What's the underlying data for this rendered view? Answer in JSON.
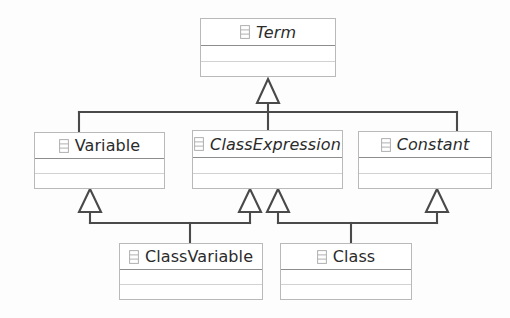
{
  "diagram": {
    "kind": "uml-class-diagram",
    "icon_name": "uml-class-icon",
    "colors": {
      "background": "#fdfdfd",
      "box_fill": "#ffffff",
      "box_border": "#b9b9b9",
      "header_rule": "#8d8d8d",
      "compartment_rule": "#d2d2d2",
      "connector": "#4a4a4a",
      "text": "#2b2b2b"
    },
    "classes": [
      {
        "id": "term",
        "name": "Term",
        "abstract": true,
        "compartments": 2
      },
      {
        "id": "variable",
        "name": "Variable",
        "abstract": false,
        "compartments": 2
      },
      {
        "id": "classexpression",
        "name": "ClassExpression",
        "abstract": true,
        "compartments": 2
      },
      {
        "id": "constant",
        "name": "Constant",
        "abstract": true,
        "compartments": 2
      },
      {
        "id": "classvariable",
        "name": "ClassVariable",
        "abstract": false,
        "compartments": 2
      },
      {
        "id": "class",
        "name": "Class",
        "abstract": false,
        "compartments": 2
      }
    ],
    "generalizations": [
      {
        "subclass": "Variable",
        "superclass": "Term"
      },
      {
        "subclass": "ClassExpression",
        "superclass": "Term"
      },
      {
        "subclass": "Constant",
        "superclass": "Term"
      },
      {
        "subclass": "ClassVariable",
        "superclass": "Variable"
      },
      {
        "subclass": "ClassVariable",
        "superclass": "ClassExpression"
      },
      {
        "subclass": "Class",
        "superclass": "ClassExpression"
      },
      {
        "subclass": "Class",
        "superclass": "Constant"
      }
    ]
  }
}
